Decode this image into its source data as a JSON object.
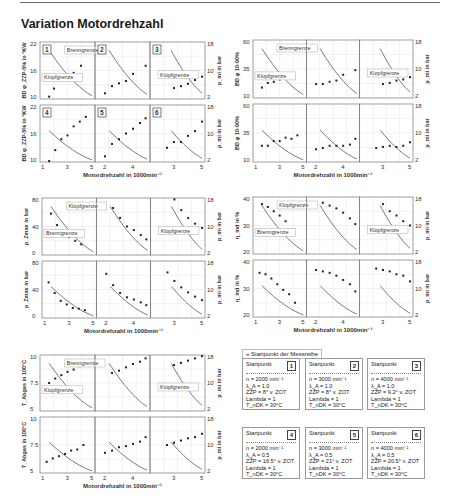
{
  "title": "Variation Motordrehzahl",
  "xlabel": "Motordrehzahl in 1000min⁻¹",
  "right_axis_label": "p_mi in bar",
  "right_axis_ticks": [
    "2",
    "10",
    "18"
  ],
  "legend_note": "» Startpunkt der Messreihe",
  "startpoints": [
    {
      "id": "1",
      "title": "Startpunkt",
      "lines": [
        "n = 2000 min⁻¹",
        "λ_A = 1.0",
        "ZŽP = 8° v. ZOT",
        "Lambda = 1",
        "T_nDK = 30°C"
      ]
    },
    {
      "id": "2",
      "title": "Startpunkt",
      "lines": [
        "n = 3000 min⁻¹",
        "λ_A = 1.0",
        "ZŽP = 8° v. ZOT",
        "Lambda = 1",
        "T_nDK = 30°C"
      ]
    },
    {
      "id": "3",
      "title": "Startpunkt",
      "lines": [
        "n = 4000 min⁻¹",
        "λ_A = 1.0",
        "ZŽP = 9.2° v. ZOT",
        "Lambda = 1",
        "T_nDK = 30°C"
      ]
    },
    {
      "id": "4",
      "title": "Startpunkt",
      "lines": [
        "n = 2000 min⁻¹",
        "λ_A = 0.5",
        "ZŽP = 16.5° v. ZOT",
        "Lambda = 1",
        "T_nDK = 30°C"
      ]
    },
    {
      "id": "5",
      "title": "Startpunkt",
      "lines": [
        "n = 3000 min⁻¹",
        "λ_A = 0.5",
        "ZŽP = 21° v. ZOT",
        "Lambda = 1",
        "T_nDK = 30°C"
      ]
    },
    {
      "id": "6",
      "title": "Startpunkt",
      "lines": [
        "n = 4000 min⁻¹",
        "λ_A = 0.5",
        "ZŽP = 20.5° v. ZOT",
        "Lambda = 1",
        "T_nDK = 30°C"
      ]
    }
  ],
  "chart_data": [
    {
      "type": "scatter",
      "title": "BD φ_Z/VB in °KW",
      "ylabel": "BD φ_ZZP-5% in °KW",
      "yticks": [
        "10",
        "16",
        "22"
      ],
      "ylim": [
        10,
        22
      ],
      "panels": [
        {
          "id": "1",
          "x_ticks": [
            "1",
            "3",
            "5"
          ],
          "points": [
            [
              1.5,
              10.5
            ],
            [
              1.9,
              12.2
            ],
            [
              2.5,
              14.2
            ],
            [
              3.0,
              14.0
            ],
            [
              3.5,
              15.5
            ],
            [
              4.1,
              17.0
            ]
          ],
          "annotations": [
            "Brenngrenze",
            "Klopfgrenze"
          ]
        },
        {
          "id": "2",
          "x_ticks": [
            "2",
            "4"
          ],
          "points": [
            [
              2.0,
              11.2
            ],
            [
              2.5,
              12.7
            ],
            [
              3.0,
              13.3
            ],
            [
              3.5,
              13.8
            ],
            [
              4.0,
              15.3
            ],
            [
              4.9,
              17.0
            ]
          ]
        },
        {
          "id": "3",
          "x_ticks": [
            "3",
            "5"
          ],
          "points": [
            [
              3.0,
              12.3
            ],
            [
              3.5,
              12.7
            ],
            [
              4.0,
              13.2
            ],
            [
              4.5,
              14.0
            ],
            [
              5.0,
              14.7
            ]
          ],
          "annotations": [
            "Klopfgrenze"
          ]
        },
        {
          "id": "4",
          "x_ticks": [
            "1",
            "3",
            "5"
          ],
          "points": [
            [
              1.5,
              10.2
            ],
            [
              2.0,
              12.5
            ],
            [
              2.5,
              14.8
            ],
            [
              3.0,
              15.6
            ],
            [
              3.5,
              17.5
            ],
            [
              4.0,
              18.5
            ],
            [
              4.5,
              19.5
            ]
          ]
        },
        {
          "id": "5",
          "x_ticks": [
            "2",
            "4"
          ],
          "points": [
            [
              2.0,
              11.2
            ],
            [
              2.5,
              13.8
            ],
            [
              3.0,
              14.8
            ],
            [
              3.5,
              16.0
            ],
            [
              4.0,
              17.0
            ],
            [
              4.5,
              18.2
            ],
            [
              4.9,
              19.2
            ]
          ]
        },
        {
          "id": "6",
          "x_ticks": [
            "3",
            "5"
          ],
          "points": [
            [
              2.5,
              13.0
            ],
            [
              3.0,
              14.2
            ],
            [
              3.5,
              14.2
            ],
            [
              4.0,
              15.5
            ],
            [
              4.5,
              16.5
            ],
            [
              5.0,
              18.5
            ]
          ]
        }
      ]
    },
    {
      "type": "scatter",
      "title": "BD φ 10-90%",
      "ylabel": "BD φ 10-90%",
      "yticks": [
        "10",
        "35",
        "60"
      ],
      "ylim": [
        10,
        60
      ],
      "panels": [
        {
          "id": "1",
          "points": [
            [
              1.5,
              19
            ],
            [
              2.0,
              23
            ],
            [
              2.5,
              24
            ],
            [
              3.0,
              26
            ],
            [
              3.5,
              28
            ],
            [
              4.0,
              31
            ]
          ],
          "annotations": [
            "Brenngrenze",
            "Klopfgrenze"
          ]
        },
        {
          "id": "2",
          "points": [
            [
              2.0,
              22
            ],
            [
              2.5,
              22
            ],
            [
              3.0,
              24
            ],
            [
              3.5,
              25
            ],
            [
              4.0,
              30
            ],
            [
              4.9,
              34
            ]
          ]
        },
        {
          "id": "3",
          "points": [
            [
              3.0,
              22
            ],
            [
              3.5,
              23
            ],
            [
              4.0,
              25
            ],
            [
              4.5,
              26
            ],
            [
              5.0,
              28
            ]
          ],
          "annotations": [
            "Klopfgrenze"
          ]
        },
        {
          "id": "4",
          "points": [
            [
              1.5,
              24
            ],
            [
              2.0,
              24
            ],
            [
              2.5,
              28
            ],
            [
              3.0,
              28
            ],
            [
              3.5,
              31
            ],
            [
              4.0,
              30
            ],
            [
              4.5,
              33
            ]
          ]
        },
        {
          "id": "5",
          "points": [
            [
              2.0,
              21
            ],
            [
              2.5,
              22
            ],
            [
              3.0,
              24
            ],
            [
              3.5,
              24
            ],
            [
              4.0,
              24
            ],
            [
              4.5,
              25
            ],
            [
              4.9,
              30
            ]
          ]
        },
        {
          "id": "6",
          "points": [
            [
              2.5,
              22
            ],
            [
              3.0,
              23
            ],
            [
              3.5,
              24
            ],
            [
              4.0,
              23
            ],
            [
              4.5,
              24
            ],
            [
              5.0,
              27
            ]
          ]
        }
      ]
    },
    {
      "type": "scatter",
      "title": "p_Zmax in bar",
      "ylabel": "p_Zmax in bar",
      "yticks": [
        "0",
        "40",
        "80"
      ],
      "ylim": [
        0,
        80
      ],
      "panels": [
        {
          "id": "1",
          "points": [
            [
              1.5,
              58
            ],
            [
              2.0,
              42
            ],
            [
              2.5,
              31
            ],
            [
              3.0,
              25
            ],
            [
              3.5,
              20
            ],
            [
              4.0,
              15
            ]
          ],
          "annotations": [
            "Klopfgrenze",
            "Brenngrenze"
          ]
        },
        {
          "id": "2",
          "points": [
            [
              2.5,
              66
            ],
            [
              3.0,
              52
            ],
            [
              3.5,
              40
            ],
            [
              4.0,
              35
            ],
            [
              4.5,
              28
            ],
            [
              4.9,
              22
            ]
          ]
        },
        {
          "id": "3",
          "points": [
            [
              3.0,
              78
            ],
            [
              3.5,
              63
            ],
            [
              4.0,
              52
            ],
            [
              4.5,
              44
            ],
            [
              5.0,
              38
            ]
          ],
          "annotations": [
            "Klopfgrenze"
          ]
        },
        {
          "id": "4",
          "points": [
            [
              1.3,
              50
            ],
            [
              1.8,
              35
            ],
            [
              2.3,
              24
            ],
            [
              2.8,
              19
            ],
            [
              3.3,
              14
            ],
            [
              3.8,
              13
            ],
            [
              4.3,
              11
            ]
          ]
        },
        {
          "id": "5",
          "points": [
            [
              2.0,
              62
            ],
            [
              2.5,
              46
            ],
            [
              3.0,
              35
            ],
            [
              3.5,
              29
            ],
            [
              4.0,
              26
            ],
            [
              4.5,
              22
            ],
            [
              4.9,
              18
            ]
          ]
        },
        {
          "id": "6",
          "points": [
            [
              2.5,
              64
            ],
            [
              3.0,
              52
            ],
            [
              3.5,
              43
            ],
            [
              4.0,
              36
            ],
            [
              4.5,
              30
            ],
            [
              5.0,
              25
            ]
          ]
        }
      ]
    },
    {
      "type": "scatter",
      "title": "η_ind in %",
      "ylabel": "η_ind in %",
      "yticks": [
        "20",
        "30",
        "40"
      ],
      "ylim": [
        20,
        40
      ],
      "panels": [
        {
          "id": "1",
          "points": [
            [
              1.5,
              37.5
            ],
            [
              2.0,
              36.5
            ],
            [
              2.5,
              35
            ],
            [
              3.0,
              33.5
            ],
            [
              3.5,
              31.5
            ],
            [
              4.0,
              28.5
            ]
          ],
          "annotations": [
            "Klopfgrenze",
            "Brenngrenze"
          ]
        },
        {
          "id": "2",
          "points": [
            [
              2.5,
              38
            ],
            [
              3.0,
              37
            ],
            [
              3.5,
              36
            ],
            [
              4.0,
              34.5
            ],
            [
              4.5,
              32.5
            ],
            [
              4.9,
              30.5
            ]
          ]
        },
        {
          "id": "3",
          "points": [
            [
              3.0,
              37.5
            ],
            [
              3.5,
              35
            ],
            [
              4.0,
              33.5
            ],
            [
              4.5,
              31.5
            ],
            [
              5.0,
              30
            ]
          ],
          "annotations": [
            "Klopfgrenze"
          ]
        },
        {
          "id": "4",
          "points": [
            [
              1.3,
              35.5
            ],
            [
              1.8,
              35
            ],
            [
              2.3,
              33.5
            ],
            [
              2.8,
              31.5
            ],
            [
              3.3,
              29.5
            ],
            [
              3.8,
              28
            ],
            [
              4.3,
              25
            ]
          ]
        },
        {
          "id": "5",
          "points": [
            [
              2.0,
              36.5
            ],
            [
              2.5,
              36
            ],
            [
              3.0,
              35.5
            ],
            [
              3.5,
              34.5
            ],
            [
              4.0,
              33
            ],
            [
              4.5,
              31.5
            ],
            [
              4.9,
              29
            ]
          ]
        },
        {
          "id": "6",
          "points": [
            [
              2.5,
              37
            ],
            [
              3.0,
              36.5
            ],
            [
              3.5,
              36
            ],
            [
              4.0,
              35
            ],
            [
              4.5,
              34.5
            ],
            [
              5.0,
              32.5
            ]
          ]
        }
      ]
    },
    {
      "type": "scatter",
      "title": "T_Abg in 100°C",
      "ylabel": "T_Abgas in 100°C",
      "yticks": [
        "5",
        "7.5",
        "10"
      ],
      "ylim": [
        5,
        10
      ],
      "panels": [
        {
          "id": "1",
          "points": [
            [
              1.5,
              7.5
            ],
            [
              2.0,
              7.9
            ],
            [
              2.5,
              8.2
            ],
            [
              3.0,
              8.5
            ],
            [
              3.5,
              8.7
            ],
            [
              4.0,
              9.0
            ]
          ],
          "annotations": [
            "Brenngrenze",
            "Klopfgrenze"
          ]
        },
        {
          "id": "2",
          "points": [
            [
              2.5,
              8.4
            ],
            [
              3.0,
              8.6
            ],
            [
              3.5,
              8.9
            ],
            [
              4.0,
              9.2
            ],
            [
              4.5,
              9.4
            ],
            [
              4.9,
              9.7
            ]
          ]
        },
        {
          "id": "3",
          "points": [
            [
              3.0,
              9.1
            ],
            [
              3.5,
              9.3
            ],
            [
              4.0,
              9.5
            ],
            [
              4.5,
              9.7
            ],
            [
              5.0,
              9.9
            ]
          ],
          "annotations": [
            "Klopfgrenze"
          ]
        },
        {
          "id": "4",
          "points": [
            [
              1.3,
              6.0
            ],
            [
              1.8,
              6.3
            ],
            [
              2.3,
              6.5
            ],
            [
              2.8,
              6.7
            ],
            [
              3.3,
              7.0
            ],
            [
              3.8,
              7.1
            ],
            [
              4.3,
              7.5
            ]
          ]
        },
        {
          "id": "5",
          "points": [
            [
              2.0,
              6.8
            ],
            [
              2.5,
              7.0
            ],
            [
              3.0,
              7.3
            ],
            [
              3.5,
              7.4
            ],
            [
              4.0,
              7.6
            ],
            [
              4.5,
              7.8
            ],
            [
              4.9,
              8.2
            ]
          ]
        },
        {
          "id": "6",
          "points": [
            [
              2.5,
              7.5
            ],
            [
              3.0,
              7.7
            ],
            [
              3.5,
              7.9
            ],
            [
              4.0,
              8.1
            ],
            [
              4.5,
              8.2
            ],
            [
              5.0,
              8.5
            ]
          ]
        }
      ]
    }
  ]
}
